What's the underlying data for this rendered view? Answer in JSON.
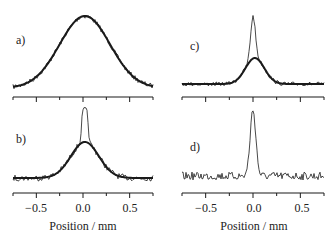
{
  "figure": {
    "xlabel": "Position / mm",
    "panel_labels": [
      "a)",
      "b)",
      "c)",
      "d)"
    ],
    "tick_labels": [
      "−0.5",
      "0.0",
      "0.5"
    ]
  },
  "chart_data": [
    {
      "panel": "a)",
      "type": "line",
      "xlabel": "",
      "xlim": [
        -0.75,
        0.75
      ],
      "xticks": [
        -0.75,
        -0.5,
        -0.25,
        0.0,
        0.25,
        0.5,
        0.75
      ],
      "grid": false,
      "series": [
        {
          "name": "measured profile (noisy)",
          "style": "thin",
          "peak_x": 0.0,
          "shape": "broad gaussian",
          "sigma_mm": 0.27,
          "noise": "low"
        },
        {
          "name": "gaussian fit",
          "style": "thick",
          "peak_x": 0.0,
          "sigma_mm": 0.27
        }
      ]
    },
    {
      "panel": "b)",
      "type": "line",
      "xlabel": "Position / mm",
      "xlim": [
        -0.75,
        0.75
      ],
      "xticks": [
        -0.75,
        -0.5,
        -0.25,
        0.0,
        0.25,
        0.5,
        0.75
      ],
      "xtick_labels": [
        "-0.5",
        "0.0",
        "0.5"
      ],
      "grid": false,
      "series": [
        {
          "name": "measured profile (noisy)",
          "style": "thin",
          "peak_x": 0.02,
          "shape": "broad gaussian + narrow central peak (width ~0.1 mm)",
          "noise": "medium"
        },
        {
          "name": "gaussian fit",
          "style": "thick",
          "peak_x": 0.02,
          "sigma_mm": 0.15
        }
      ]
    },
    {
      "panel": "c)",
      "type": "line",
      "xlabel": "",
      "xlim": [
        -0.75,
        0.75
      ],
      "xticks": [
        -0.75,
        -0.5,
        -0.25,
        0.0,
        0.25,
        0.5,
        0.75
      ],
      "grid": false,
      "series": [
        {
          "name": "measured profile (noisy)",
          "style": "thin",
          "peak_x": 0.0,
          "shape": "narrow tall central peak (FWHM ~0.07 mm) on broad base",
          "noise": "low"
        },
        {
          "name": "gaussian fit",
          "style": "thick",
          "peak_x": 0.02,
          "sigma_mm": 0.1
        }
      ]
    },
    {
      "panel": "d)",
      "type": "line",
      "xlabel": "Position / mm",
      "xlim": [
        -0.75,
        0.75
      ],
      "xticks": [
        -0.75,
        -0.5,
        -0.25,
        0.0,
        0.25,
        0.5,
        0.75
      ],
      "xtick_labels": [
        "-0.5",
        "0.0",
        "0.5"
      ],
      "grid": false,
      "series": [
        {
          "name": "difference profile (noisy)",
          "style": "thin",
          "peak_x": 0.0,
          "shape": "narrow single peak (FWHM ~0.08 mm) on noisy flat baseline",
          "noise": "high"
        }
      ]
    }
  ]
}
